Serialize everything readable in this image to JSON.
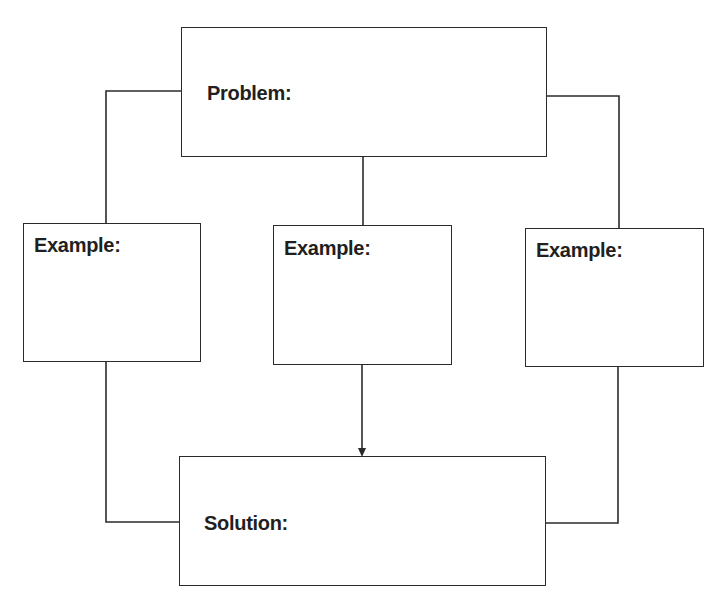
{
  "diagram": {
    "type": "graphic-organizer",
    "problem": {
      "label": "Problem:"
    },
    "examples": [
      {
        "label": "Example:"
      },
      {
        "label": "Example:"
      },
      {
        "label": "Example:"
      }
    ],
    "solution": {
      "label": "Solution:"
    },
    "colors": {
      "line": "#2b2b2b",
      "text": "#231f20",
      "background": "#ffffff"
    }
  }
}
